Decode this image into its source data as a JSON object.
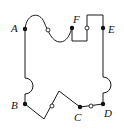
{
  "diagram": {
    "title": "",
    "stroke_color": "#1a1a1a",
    "background_color": "#ffffff",
    "points": {
      "A": {
        "label": "A",
        "x": 25,
        "y": 29,
        "type": "filled"
      },
      "B": {
        "label": "B",
        "x": 25,
        "y": 104,
        "type": "filled"
      },
      "C": {
        "label": "C",
        "x": 80,
        "y": 107,
        "type": "filled"
      },
      "D": {
        "label": "D",
        "x": 103,
        "y": 104,
        "type": "filled"
      },
      "E": {
        "label": "E",
        "x": 103,
        "y": 28,
        "type": "filled"
      },
      "F": {
        "label": "F",
        "x": 72,
        "y": 28,
        "type": "filled"
      }
    },
    "open_circles": [
      {
        "name": "midpoint-AF-curve",
        "x": 48,
        "y": 30
      },
      {
        "name": "midpoint-F-E-step",
        "x": 87,
        "y": 28
      },
      {
        "name": "midpoint-B-C-zigzag",
        "x": 52,
        "y": 106
      },
      {
        "name": "midpoint-CD",
        "x": 91,
        "y": 106
      }
    ],
    "segments": [
      {
        "from": "A",
        "to": "F",
        "shape": "s-curve"
      },
      {
        "from": "F",
        "to": "E",
        "shape": "rectangular-step"
      },
      {
        "from": "E",
        "to": "D",
        "shape": "line-with-semicircle-bump"
      },
      {
        "from": "D",
        "to": "C",
        "shape": "straight"
      },
      {
        "from": "C",
        "to": "B",
        "shape": "zigzag"
      },
      {
        "from": "B",
        "to": "A",
        "shape": "line-with-semicircle-bump"
      }
    ]
  }
}
